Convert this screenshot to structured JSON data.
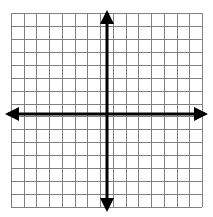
{
  "figure": {
    "title": "",
    "type": "coordinate-grid",
    "width": 213,
    "height": 217,
    "background_color": "#ffffff"
  },
  "chart_data": {
    "type": "scatter",
    "title": "",
    "subtitle": "",
    "xlabel": "",
    "ylabel": "",
    "series": [],
    "x": [],
    "values": [],
    "categories": [],
    "annotations": [],
    "legend": {
      "entries": [],
      "position": "none"
    },
    "grid": {
      "visible": true,
      "columns": 15,
      "rows": 15,
      "cell_size_px": 12.7,
      "line_color": "#808080",
      "line_width_px": 1,
      "left_px": 11,
      "top_px": 13,
      "right_px": 202,
      "bottom_px": 207
    },
    "axes": {
      "color": "#000000",
      "line_width_px": 3,
      "origin_px": {
        "x": 107,
        "y": 114
      },
      "x_axis": {
        "label": "",
        "tick_labels": [],
        "xlim": [
          -7.5,
          7.5
        ],
        "arrow_left": true,
        "arrow_right": true,
        "start_px": 5,
        "end_px": 208
      },
      "y_axis": {
        "label": "",
        "tick_labels": [],
        "ylim": [
          -7,
          8
        ],
        "arrow_up": true,
        "arrow_down": true,
        "start_px": 10,
        "end_px": 212
      }
    }
  },
  "icons": {
    "arrow_up": "arrow-up-icon",
    "arrow_down": "arrow-down-icon",
    "arrow_left": "arrow-left-icon",
    "arrow_right": "arrow-right-icon"
  }
}
